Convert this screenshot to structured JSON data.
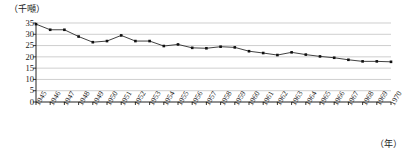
{
  "chart_data": {
    "type": "line",
    "title": "",
    "subtitle": "",
    "ylabel": "（千噸）",
    "xlabel": "（年）",
    "xlabel_position": "bottom-right",
    "ylabel_position": "top-left",
    "grid": true,
    "grid_axis": "y",
    "legend": false,
    "ylim": [
      0,
      35
    ],
    "yticks": [
      0,
      5,
      10,
      15,
      20,
      25,
      30,
      35
    ],
    "ytick_labels": [
      "0",
      "5",
      "10",
      "15",
      "20",
      "25",
      "30",
      "35"
    ],
    "xlim": [
      1945,
      1970
    ],
    "categories": [
      "1945",
      "1946",
      "1947",
      "1948",
      "1949",
      "1950",
      "1951",
      "1952",
      "1953",
      "1954",
      "1955",
      "1956",
      "1957",
      "1958",
      "1959",
      "1960",
      "1961",
      "1962",
      "1963",
      "1964",
      "1965",
      "1966",
      "1967",
      "1968",
      "1969",
      "1970"
    ],
    "values": [
      34.5,
      32.0,
      32.0,
      29.0,
      26.5,
      27.0,
      29.5,
      27.0,
      27.0,
      24.8,
      25.5,
      24.0,
      23.8,
      24.5,
      24.2,
      22.5,
      21.7,
      20.8,
      22.0,
      21.0,
      20.2,
      19.6,
      18.7,
      18.0,
      18.0,
      17.8
    ],
    "series": [
      {
        "name": "",
        "marker": "square",
        "color": "#111111",
        "values": [
          34.5,
          32.0,
          32.0,
          29.0,
          26.5,
          27.0,
          29.5,
          27.0,
          27.0,
          24.8,
          25.5,
          24.0,
          23.8,
          24.5,
          24.2,
          22.5,
          21.7,
          20.8,
          22.0,
          21.0,
          20.2,
          19.6,
          18.7,
          18.0,
          18.0,
          17.8
        ]
      }
    ],
    "colors": {
      "line": "#2b2b2b",
      "marker": "#111111",
      "grid": "#b9b9b9",
      "axis": "#222222",
      "background": "#ffffff"
    }
  }
}
